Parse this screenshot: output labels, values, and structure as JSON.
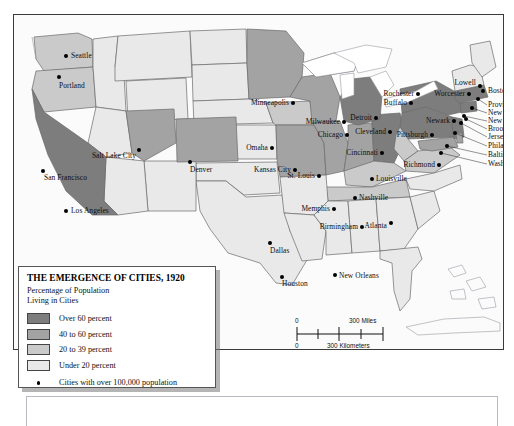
{
  "map": {
    "title": "THE EMERGENCE OF CITIES, 1920",
    "subtitle_line1": "Percentage of Population",
    "subtitle_line2": "Living in Cities",
    "colors": {
      "over_60": "#7d7d7d",
      "pct_40_60": "#a3a3a3",
      "pct_20_39": "#cacaca",
      "under_20": "#e9e9e9",
      "water": "#ffffff",
      "border": "#6a6a6a",
      "frame": "#3a3a3a",
      "dot": "#000000",
      "label": "#0d0d0d"
    },
    "legend": {
      "items": [
        {
          "label": "Over 60 percent",
          "color": "#7d7d7d"
        },
        {
          "label": "40 to 60 percent",
          "color": "#a3a3a3"
        },
        {
          "label": "20 to 39 percent",
          "color": "#cacaca"
        },
        {
          "label": "Under 20 percent",
          "color": "#e9e9e9"
        }
      ],
      "dot_note": "Cities with over 100,000 population"
    },
    "scale": {
      "miles_zero": "0",
      "miles_label": "300 Miles",
      "km_zero": "0",
      "km_label": "300 Kilometers"
    },
    "cities": [
      {
        "name": "Seattle",
        "x": 52,
        "y": 41,
        "lx": 57,
        "ly": 41,
        "side": "l"
      },
      {
        "name": "Portland",
        "x": 45,
        "y": 62,
        "lx": 45,
        "ly": 71,
        "side": "l"
      },
      {
        "name": "San Francisco",
        "x": 29,
        "y": 156,
        "lx": 30,
        "ly": 163,
        "side": "l"
      },
      {
        "name": "Los Angeles",
        "x": 52,
        "y": 196,
        "lx": 57,
        "ly": 196,
        "side": "l"
      },
      {
        "name": "Salt Lake City",
        "x": 125,
        "y": 135,
        "lx": 122,
        "ly": 141,
        "side": "r"
      },
      {
        "name": "Denver",
        "x": 176,
        "y": 147,
        "lx": 176,
        "ly": 155,
        "side": "l"
      },
      {
        "name": "Minneapolis",
        "x": 279,
        "y": 88,
        "lx": 275,
        "ly": 88,
        "side": "r"
      },
      {
        "name": "Omaha",
        "x": 258,
        "y": 133,
        "lx": 254,
        "ly": 133,
        "side": "r"
      },
      {
        "name": "Kansas City",
        "x": 281,
        "y": 155,
        "lx": 277,
        "ly": 155,
        "side": "r"
      },
      {
        "name": "St. Louis",
        "x": 305,
        "y": 161,
        "lx": 301,
        "ly": 161,
        "side": "r"
      },
      {
        "name": "Milwaukee",
        "x": 330,
        "y": 107,
        "lx": 326,
        "ly": 107,
        "side": "r"
      },
      {
        "name": "Chicago",
        "x": 333,
        "y": 120,
        "lx": 329,
        "ly": 120,
        "side": "r"
      },
      {
        "name": "Detroit",
        "x": 362,
        "y": 103,
        "lx": 358,
        "ly": 103,
        "side": "r"
      },
      {
        "name": "Cleveland",
        "x": 376,
        "y": 117,
        "lx": 372,
        "ly": 117,
        "side": "r"
      },
      {
        "name": "Cincinnati",
        "x": 368,
        "y": 138,
        "lx": 364,
        "ly": 138,
        "side": "r"
      },
      {
        "name": "Louisville",
        "x": 358,
        "y": 164,
        "lx": 362,
        "ly": 164,
        "side": "l"
      },
      {
        "name": "Rochester",
        "x": 404,
        "y": 79,
        "lx": 400,
        "ly": 79,
        "side": "r"
      },
      {
        "name": "Buffalo",
        "x": 397,
        "y": 88,
        "lx": 393,
        "ly": 88,
        "side": "r"
      },
      {
        "name": "Pittsburgh",
        "x": 418,
        "y": 120,
        "lx": 414,
        "ly": 120,
        "side": "r"
      },
      {
        "name": "Richmond",
        "x": 425,
        "y": 150,
        "lx": 421,
        "ly": 150,
        "side": "r"
      },
      {
        "name": "Lowell",
        "x": 466,
        "y": 71,
        "lx": 462,
        "ly": 68,
        "side": "r"
      },
      {
        "name": "Worcester",
        "x": 455,
        "y": 79,
        "lx": 451,
        "ly": 79,
        "side": "r"
      },
      {
        "name": "Boston",
        "x": 469,
        "y": 76,
        "lx": 474,
        "ly": 76,
        "side": "l"
      },
      {
        "name": "Newark",
        "x": 440,
        "y": 106,
        "lx": 436,
        "ly": 106,
        "side": "r"
      },
      {
        "name": "Providence",
        "x": 464,
        "y": 84,
        "lx": 474,
        "ly": 90,
        "side": "l"
      },
      {
        "name": "New Haven",
        "x": 458,
        "y": 93,
        "lx": 474,
        "ly": 98,
        "side": "l"
      },
      {
        "name": "New York",
        "x": 450,
        "y": 101,
        "lx": 474,
        "ly": 106,
        "side": "l"
      },
      {
        "name": "Brooklyn",
        "x": 452,
        "y": 104,
        "lx": 474,
        "ly": 114,
        "side": "l"
      },
      {
        "name": "Jersey City",
        "x": 447,
        "y": 108,
        "lx": 474,
        "ly": 122,
        "side": "l"
      },
      {
        "name": "Philadelphia",
        "x": 441,
        "y": 118,
        "lx": 474,
        "ly": 131,
        "side": "l"
      },
      {
        "name": "Baltimore",
        "x": 433,
        "y": 131,
        "lx": 474,
        "ly": 140,
        "side": "l"
      },
      {
        "name": "Washington",
        "x": 427,
        "y": 138,
        "lx": 474,
        "ly": 149,
        "side": "l"
      },
      {
        "name": "Nashville",
        "x": 341,
        "y": 183,
        "lx": 345,
        "ly": 183,
        "side": "l"
      },
      {
        "name": "Memphis",
        "x": 320,
        "y": 194,
        "lx": 316,
        "ly": 194,
        "side": "r"
      },
      {
        "name": "Birmingham",
        "x": 348,
        "y": 212,
        "lx": 344,
        "ly": 212,
        "side": "r"
      },
      {
        "name": "Atlanta",
        "x": 377,
        "y": 208,
        "lx": 373,
        "ly": 211,
        "side": "r"
      },
      {
        "name": "Dallas",
        "x": 256,
        "y": 228,
        "lx": 256,
        "ly": 236,
        "side": "l"
      },
      {
        "name": "Houston",
        "x": 268,
        "y": 262,
        "lx": 268,
        "ly": 269,
        "side": "l"
      },
      {
        "name": "New Orleans",
        "x": 321,
        "y": 260,
        "lx": 325,
        "ly": 261,
        "side": "l"
      }
    ]
  }
}
